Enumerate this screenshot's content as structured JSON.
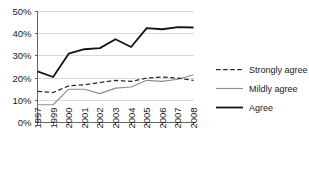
{
  "chart_data": {
    "type": "line",
    "title": "",
    "xlabel": "",
    "ylabel": "",
    "ylim": [
      0,
      50
    ],
    "ytick_labels": [
      "0%",
      "10%",
      "20%",
      "30%",
      "40%",
      "50%"
    ],
    "ytick_values": [
      0,
      10,
      20,
      30,
      40,
      50
    ],
    "grid": true,
    "legend_position": "right",
    "categories": [
      "1997",
      "1999",
      "2000",
      "2001",
      "2002",
      "2003",
      "2004",
      "2005",
      "2006",
      "2007",
      "2008"
    ],
    "series": [
      {
        "name": "Strongly agree",
        "style": "dashed",
        "color": "#2b2b2b",
        "values": [
          14,
          13.5,
          16.5,
          17,
          18,
          19,
          18.5,
          20,
          20.5,
          20,
          19
        ]
      },
      {
        "name": "Mildly agree",
        "style": "solid-thin",
        "color": "#8e8e8e",
        "values": [
          8,
          8,
          15,
          15,
          13,
          15.5,
          16,
          19,
          18.5,
          19.5,
          21.5
        ]
      },
      {
        "name": "Agree",
        "style": "solid-thick",
        "color": "#141414",
        "values": [
          23,
          20.5,
          31,
          33,
          33.5,
          37.5,
          34,
          42.5,
          42,
          43,
          42.8
        ]
      }
    ]
  },
  "legend": {
    "items": [
      {
        "label": "Strongly agree"
      },
      {
        "label": "Mildly agree"
      },
      {
        "label": "Agree"
      }
    ]
  }
}
